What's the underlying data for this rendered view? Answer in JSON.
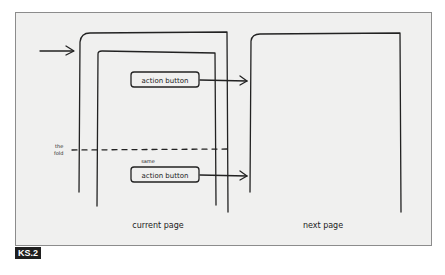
{
  "figure": {
    "label": "KS.2",
    "colors": {
      "background": "#f0f0ef",
      "ink": "#222222",
      "frame_border": "#8c8c8c",
      "label_bg": "#1f1f1f"
    }
  },
  "diagram": {
    "fold_label_line1": "the",
    "fold_label_line2": "fold",
    "button_top_label": "action button",
    "button_bottom_caption": "same",
    "button_bottom_label": "action button",
    "current_page_label": "current page",
    "next_page_label": "next page"
  }
}
